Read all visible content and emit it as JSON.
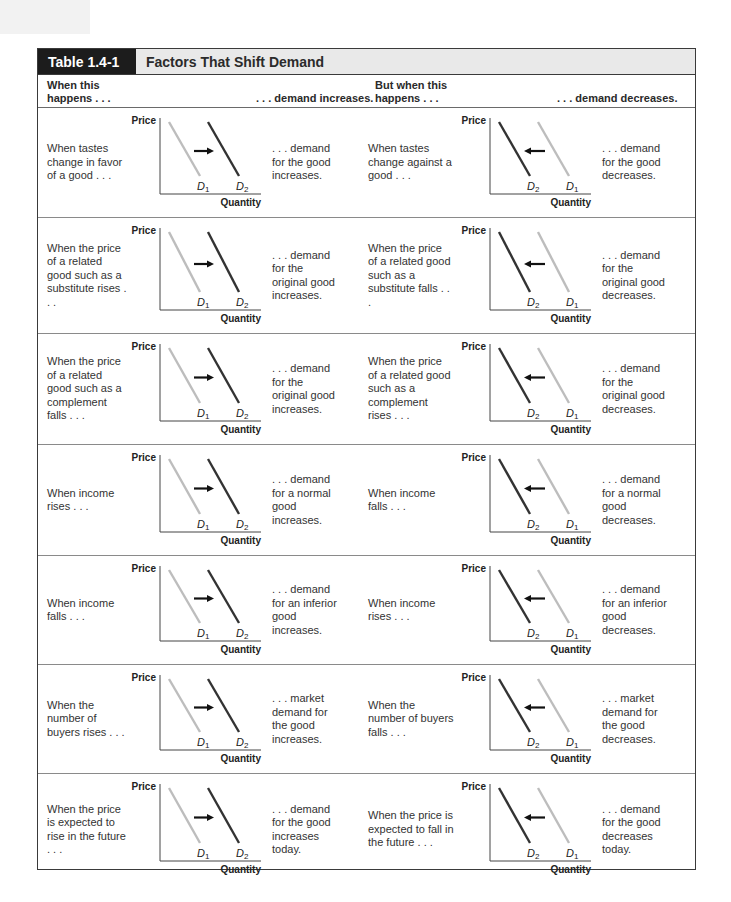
{
  "table": {
    "number": "Table 1.4-1",
    "title": "Factors That Shift Demand"
  },
  "header": {
    "col1": "When this happens . . .",
    "col1_line1": "When this",
    "col1_line2": "happens . . .",
    "col2": ". . . demand increases.",
    "col3_line1": "But when this",
    "col3_line2": "happens . . .",
    "col4": ". . . demand decreases."
  },
  "graph_labels": {
    "y_axis": "Price",
    "x_axis": "Quantity",
    "d1": "D",
    "d1_sub": "1",
    "d2": "D",
    "d2_sub": "2"
  },
  "colors": {
    "title_tag_bg": "#1c1c1c",
    "title_bar_bg": "#e9e9e9",
    "curve_original": "#bdbdbd",
    "curve_shifted": "#333333",
    "arrow": "#111111"
  },
  "rows": [
    {
      "increase_condition": "When tastes change in favor of a good . . .",
      "increase_result": ". . . demand for the good increases.",
      "decrease_condition": "When tastes change against a good . . .",
      "decrease_result": ". . . demand for the good decreases."
    },
    {
      "increase_condition": "When the price of a related good such as a substitute rises . . .",
      "increase_result": ". . . demand for the original good increases.",
      "decrease_condition": "When the price of a related good such as a substitute falls . . .",
      "decrease_result": ". . . demand for the original good decreases."
    },
    {
      "increase_condition": "When the price of a related good such as a complement falls . . .",
      "increase_result": ". . . demand for the original good increases.",
      "decrease_condition": "When the price of a related good such as a complement rises . . .",
      "decrease_result": ". . . demand for the original good decreases."
    },
    {
      "increase_condition": "When income rises . . .",
      "increase_result": ". . . demand for a normal good increases.",
      "decrease_condition": "When income falls . . .",
      "decrease_result": ". . . demand for a normal good decreases."
    },
    {
      "increase_condition": "When income falls . . .",
      "increase_result": ". . . demand for an inferior good increases.",
      "decrease_condition": "When income rises . . .",
      "decrease_result": ". . . demand for an inferior good decreases."
    },
    {
      "increase_condition": "When the number of buyers rises . . .",
      "increase_result": ". . . market demand for the good increases.",
      "decrease_condition": "When the number of buyers falls . . .",
      "decrease_result": ". . . market demand for the good decreases."
    },
    {
      "increase_condition": "When the price is expected to rise in the future . . .",
      "increase_result": ". . . demand for the good increases today.",
      "decrease_condition": "When the price is expected to fall in the future . . .",
      "decrease_result": ". . . demand for the good decreases today."
    }
  ]
}
